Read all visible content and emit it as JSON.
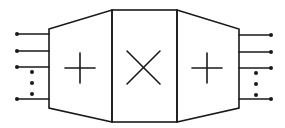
{
  "diagram": {
    "stroke_color": "#1a1a1a",
    "background": "#ffffff",
    "blocks": [
      {
        "id": "left-adder",
        "shape": "trapezoid",
        "symbol": "+",
        "label": "+"
      },
      {
        "id": "center-multiplier",
        "shape": "rectangle",
        "symbol": "×",
        "label": "×"
      },
      {
        "id": "right-adder",
        "shape": "trapezoid",
        "symbol": "+",
        "label": "+"
      }
    ],
    "inputs": {
      "count_visible": 4,
      "ellipsis": "⋮"
    },
    "outputs": {
      "count_visible": 4,
      "ellipsis": "⋮"
    }
  }
}
